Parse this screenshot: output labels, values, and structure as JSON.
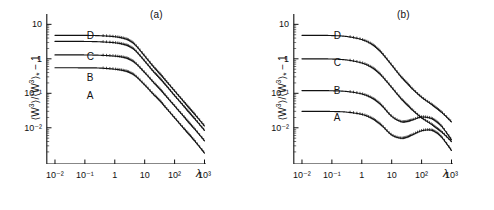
{
  "figure": {
    "background": "#ffffff",
    "line_color": "#111111",
    "marker_color": "#111111"
  },
  "panels": [
    {
      "id": "a",
      "label": "(a)",
      "ylabel_parts": {
        "open": "⟨W",
        "exp": "3",
        "close": "⟩/⟨W",
        "exp2": "3",
        "star": "*",
        "tail": " − 1"
      },
      "ylabel_text": "⟨W³⟩/⟨W³⟩* − 1",
      "xlabel": "λ",
      "xticks": [
        "10⁻²",
        "10⁻¹",
        "1",
        "10",
        "10²",
        "10³"
      ],
      "xtick_values": [
        -2,
        -1,
        0,
        1,
        2,
        3
      ],
      "yticks": [
        "10",
        "1",
        "10⁻¹",
        "10⁻²"
      ],
      "ytick_values": [
        1,
        0,
        -1,
        -2
      ],
      "curve_labels": [
        {
          "text": "D",
          "x": 0.255,
          "y": 0.105
        },
        {
          "text": "C",
          "x": 0.255,
          "y": 0.245
        },
        {
          "text": "B",
          "x": 0.255,
          "y": 0.385
        },
        {
          "text": "A",
          "x": 0.255,
          "y": 0.505
        }
      ]
    },
    {
      "id": "b",
      "label": "(b)",
      "ylabel_text": "⟨W³⟩/⟨W³⟩* − 1",
      "xlabel": "λ",
      "xticks": [
        "10⁻²",
        "10⁻¹",
        "1",
        "10",
        "10²",
        "10³"
      ],
      "xtick_values": [
        -2,
        -1,
        0,
        1,
        2,
        3
      ],
      "yticks": [
        "10",
        "1",
        "10⁻¹",
        "10⁻²"
      ],
      "ytick_values": [
        1,
        0,
        -1,
        -2
      ],
      "curve_labels": [
        {
          "text": "D",
          "x": 0.255,
          "y": 0.105
        },
        {
          "text": "C",
          "x": 0.255,
          "y": 0.285
        },
        {
          "text": "B",
          "x": 0.255,
          "y": 0.475
        },
        {
          "text": "A",
          "x": 0.255,
          "y": 0.655
        }
      ]
    }
  ],
  "chart_data": [
    {
      "type": "line",
      "panel": "a",
      "title": "(a)",
      "xlabel": "λ",
      "ylabel": "⟨W³⟩/⟨W³⟩* − 1",
      "xscale": "log",
      "yscale": "log",
      "xlim": [
        0.01,
        1000
      ],
      "ylim": [
        0.001,
        20
      ],
      "grid": false,
      "legend": "inline-curve-labels",
      "xticks": [
        0.01,
        0.1,
        1,
        10,
        100,
        1000
      ],
      "yticks": [
        10,
        1,
        0.1,
        0.01
      ],
      "series": [
        {
          "name": "A",
          "plateau": 0.55,
          "x": [
            0.01,
            0.0316,
            0.1,
            0.316,
            1,
            2,
            3.16,
            5,
            10,
            20,
            31.6,
            50,
            100,
            200,
            316,
            500,
            1000
          ],
          "y": [
            0.55,
            0.55,
            0.548,
            0.54,
            0.5,
            0.455,
            0.4,
            0.315,
            0.175,
            0.092,
            0.062,
            0.039,
            0.0195,
            0.0097,
            0.0062,
            0.0039,
            0.00185
          ]
        },
        {
          "name": "B",
          "plateau": 1.3,
          "x": [
            0.01,
            0.0316,
            0.1,
            0.316,
            1,
            2,
            3.16,
            5,
            10,
            20,
            31.6,
            50,
            100,
            200,
            316,
            500,
            1000
          ],
          "y": [
            1.3,
            1.3,
            1.295,
            1.27,
            1.2,
            1.1,
            0.96,
            0.74,
            0.4,
            0.205,
            0.135,
            0.086,
            0.043,
            0.0215,
            0.0135,
            0.0086,
            0.0042
          ]
        },
        {
          "name": "C",
          "plateau": 3.2,
          "x": [
            0.01,
            0.0316,
            0.1,
            0.316,
            1,
            2,
            3.16,
            5,
            10,
            20,
            31.6,
            50,
            100,
            200,
            316,
            500,
            1000
          ],
          "y": [
            3.2,
            3.2,
            3.19,
            3.12,
            2.92,
            2.62,
            2.26,
            1.7,
            0.86,
            0.42,
            0.275,
            0.175,
            0.086,
            0.043,
            0.027,
            0.0172,
            0.0084
          ]
        },
        {
          "name": "D",
          "plateau": 4.8,
          "x": [
            0.01,
            0.0316,
            0.1,
            0.316,
            1,
            2,
            3.16,
            5,
            10,
            20,
            31.6,
            50,
            100,
            200,
            316,
            500,
            1000
          ],
          "y": [
            4.8,
            4.8,
            4.78,
            4.68,
            4.38,
            3.92,
            3.35,
            2.46,
            1.21,
            0.58,
            0.375,
            0.237,
            0.117,
            0.058,
            0.0365,
            0.0232,
            0.0113
          ]
        }
      ]
    },
    {
      "type": "line",
      "panel": "b",
      "title": "(b)",
      "xlabel": "λ",
      "ylabel": "⟨W³⟩/⟨W³⟩* − 1",
      "xscale": "log",
      "yscale": "log",
      "xlim": [
        0.01,
        1000
      ],
      "ylim": [
        0.001,
        20
      ],
      "grid": false,
      "legend": "inline-curve-labels",
      "xticks": [
        0.01,
        0.1,
        1,
        10,
        100,
        1000
      ],
      "yticks": [
        10,
        1,
        0.1,
        0.01
      ],
      "series": [
        {
          "name": "A",
          "plateau": 0.03,
          "x": [
            0.01,
            0.0316,
            0.1,
            0.316,
            1,
            2,
            3.16,
            5,
            10,
            20,
            31.6,
            50,
            100,
            200,
            316,
            500,
            1000
          ],
          "y": [
            0.03,
            0.03,
            0.0297,
            0.0285,
            0.0245,
            0.0195,
            0.0152,
            0.011,
            0.0062,
            0.005,
            0.0053,
            0.0063,
            0.0082,
            0.0086,
            0.0072,
            0.005,
            0.0022
          ]
        },
        {
          "name": "B",
          "plateau": 0.12,
          "x": [
            0.01,
            0.0316,
            0.1,
            0.316,
            1,
            2,
            3.16,
            5,
            10,
            20,
            31.6,
            50,
            100,
            200,
            316,
            500,
            1000
          ],
          "y": [
            0.12,
            0.12,
            0.1185,
            0.113,
            0.096,
            0.076,
            0.059,
            0.0415,
            0.0215,
            0.0152,
            0.0152,
            0.017,
            0.0205,
            0.019,
            0.015,
            0.0103,
            0.0045
          ]
        },
        {
          "name": "C",
          "plateau": 1.0,
          "x": [
            0.01,
            0.0316,
            0.1,
            0.316,
            1,
            2,
            3.16,
            5,
            10,
            20,
            31.6,
            50,
            100,
            200,
            316,
            500,
            1000
          ],
          "y": [
            1.0,
            1.0,
            0.985,
            0.925,
            0.76,
            0.585,
            0.44,
            0.3,
            0.148,
            0.072,
            0.048,
            0.0325,
            0.0195,
            0.0132,
            0.0098,
            0.0072,
            0.004
          ]
        },
        {
          "name": "D",
          "plateau": 4.8,
          "x": [
            0.01,
            0.0316,
            0.1,
            0.316,
            1,
            2,
            3.16,
            5,
            10,
            20,
            31.6,
            50,
            100,
            200,
            316,
            500,
            1000
          ],
          "y": [
            4.8,
            4.8,
            4.73,
            4.44,
            3.62,
            2.76,
            2.05,
            1.38,
            0.66,
            0.31,
            0.203,
            0.133,
            0.077,
            0.05,
            0.037,
            0.0268,
            0.0148
          ]
        }
      ]
    }
  ]
}
